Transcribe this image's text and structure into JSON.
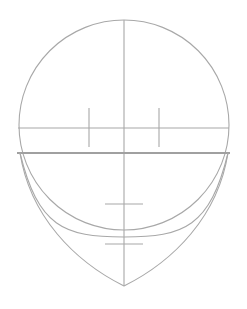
{
  "diagram": {
    "stroke_color": "#a8a8a8",
    "background": "#ffffff",
    "cranium_circle": {
      "cx": 124,
      "cy": 125,
      "r": 105
    },
    "center_line": {
      "x": 124,
      "y1": 20,
      "y2": 286
    },
    "brow_line": {
      "y": 128,
      "x1": 18,
      "x2": 229
    },
    "eye_line": {
      "y": 153,
      "x1": 17,
      "x2": 230
    },
    "eye_ticks": [
      {
        "x": 89,
        "y1": 108,
        "y2": 147
      },
      {
        "x": 159,
        "y1": 108,
        "y2": 147
      }
    ],
    "nose_tick": {
      "y": 204,
      "x1": 105,
      "x2": 143
    },
    "mouth_tick": {
      "y": 244,
      "x1": 105,
      "x2": 143
    },
    "inner_jaw_arc": {
      "start": [
        20,
        153
      ],
      "bottom": [
        124,
        237
      ],
      "end": [
        228,
        153
      ]
    },
    "outer_jaw": {
      "start_left": [
        20,
        153
      ],
      "chin": [
        124,
        286
      ],
      "start_right": [
        228,
        153
      ]
    }
  }
}
